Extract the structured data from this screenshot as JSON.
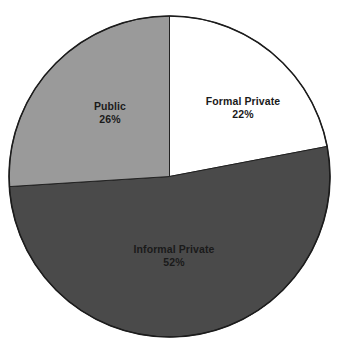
{
  "chart_data": {
    "type": "pie",
    "title": "",
    "subtitle": "",
    "xlabel": "",
    "ylabel": "",
    "legend": "none",
    "grid": false,
    "value_unit": "%",
    "start_angle_deg": 0,
    "direction": "clockwise",
    "categories": [
      "Formal Private",
      "Informal Private",
      "Public"
    ],
    "values": [
      22,
      52,
      26
    ],
    "slices": [
      {
        "label": "Formal Private",
        "value": 22,
        "value_text": "22%",
        "color": "#ffffff",
        "start_angle_deg": 0,
        "end_angle_deg": 79.2
      },
      {
        "label": "Informal Private",
        "value": 52,
        "value_text": "52%",
        "color": "#4a4a4a",
        "start_angle_deg": 79.2,
        "end_angle_deg": 266.4
      },
      {
        "label": "Public",
        "value": 26,
        "value_text": "26%",
        "color": "#9a9a9a",
        "start_angle_deg": 266.4,
        "end_angle_deg": 360
      }
    ],
    "outline_color": "#1c1c1c",
    "background_color": "#ffffff",
    "label_color": "#1a1a1a"
  },
  "geometry": {
    "center_x": 169.5,
    "center_y": 176.5,
    "radius": 160.5,
    "stroke_width": 1.6
  }
}
